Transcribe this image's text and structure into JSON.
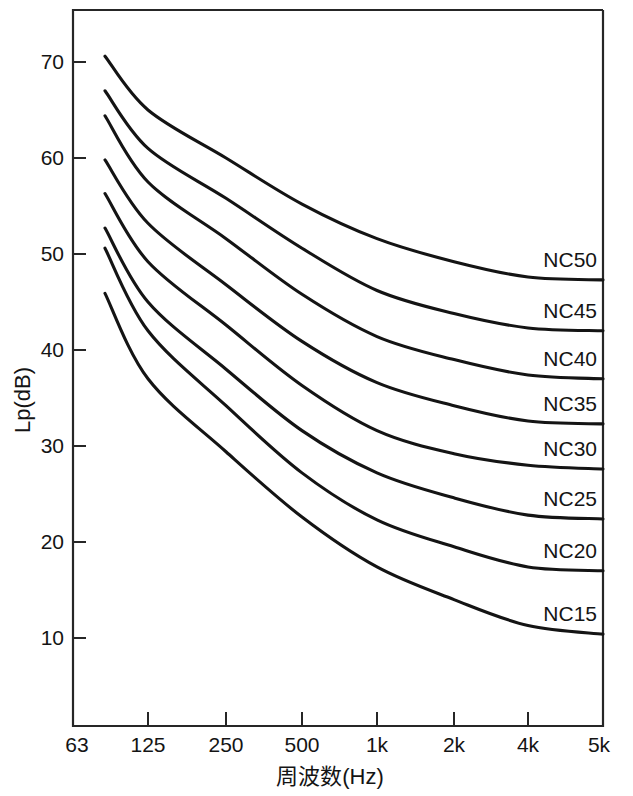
{
  "chart_data": {
    "type": "line",
    "title": "",
    "xlabel": "周波数(Hz)",
    "ylabel": "Lp(dB)",
    "x_tick_labels": [
      "63",
      "125",
      "250",
      "500",
      "1k",
      "2k",
      "4k",
      "5k"
    ],
    "y_tick_labels": [
      "70",
      "60",
      "50",
      "40",
      "30",
      "20",
      "10"
    ],
    "y_tick_values": [
      70,
      60,
      50,
      40,
      30,
      20,
      10
    ],
    "ylim": [
      4,
      76
    ],
    "grid": false,
    "legend_position": "inline-right-of-curve",
    "x_categories": [
      63,
      125,
      250,
      500,
      1000,
      2000,
      4000,
      5000
    ],
    "series": [
      {
        "name": "NC50",
        "label": "NC50",
        "values": [
          70.6,
          65.0,
          60.0,
          55.2,
          51.6,
          49.2,
          47.6,
          47.3
        ]
      },
      {
        "name": "NC45",
        "label": "NC45",
        "values": [
          67.0,
          61.0,
          55.8,
          50.6,
          46.2,
          43.8,
          42.3,
          42.0
        ]
      },
      {
        "name": "NC40",
        "label": "NC40",
        "values": [
          64.4,
          57.5,
          51.6,
          45.8,
          41.4,
          39.0,
          37.4,
          37.0
        ]
      },
      {
        "name": "NC35",
        "label": "NC35",
        "values": [
          59.8,
          53.2,
          46.8,
          40.9,
          36.6,
          34.2,
          32.6,
          32.3
        ]
      },
      {
        "name": "NC30",
        "label": "NC30",
        "values": [
          56.3,
          49.2,
          42.6,
          36.3,
          31.6,
          29.2,
          28.0,
          27.6
        ]
      },
      {
        "name": "NC25",
        "label": "NC25",
        "values": [
          52.7,
          45.0,
          38.0,
          31.6,
          27.2,
          24.6,
          22.8,
          22.4
        ]
      },
      {
        "name": "NC20",
        "label": "NC20",
        "values": [
          50.6,
          42.0,
          34.2,
          27.2,
          22.3,
          19.5,
          17.4,
          17.0
        ]
      },
      {
        "name": "NC15",
        "label": "NC15",
        "values": [
          45.9,
          37.0,
          29.4,
          22.6,
          17.4,
          14.0,
          11.3,
          10.4
        ]
      }
    ]
  },
  "axes": {
    "y_title": "Lp(dB)",
    "x_title": "周波数(Hz)"
  }
}
